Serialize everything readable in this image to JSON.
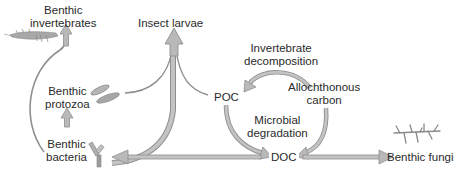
{
  "diagram": {
    "type": "food-web",
    "colors": {
      "arrow_fill": "#b9b9b9",
      "arrow_stroke": "#8e8e8e",
      "text": "#2a2a2a",
      "organism": "#9a9a9a"
    },
    "nodes": {
      "benthic_invertebrates": {
        "line1": "Benthic",
        "line2": "invertebrates",
        "icon": "shrimp-icon"
      },
      "insect_larvae": {
        "line1": "Insect larvae",
        "icon": ""
      },
      "benthic_protozoa": {
        "line1": "Benthic",
        "line2": "protozoa",
        "icon": "protozoa-icon"
      },
      "benthic_bacteria": {
        "line1": "Benthic",
        "line2": "bacteria",
        "icon": "bacteria-icon"
      },
      "poc": {
        "line1": "POC"
      },
      "doc": {
        "line1": "DOC"
      },
      "allochthonous_carbon": {
        "line1": "Allochthonous",
        "line2": "carbon"
      },
      "benthic_fungi": {
        "line1": "Benthic fungi",
        "icon": "fungi-icon"
      }
    },
    "process_labels": {
      "invertebrate_decomposition": {
        "line1": "Invertebrate",
        "line2": "decomposition"
      },
      "microbial_degradation": {
        "line1": "Microbial",
        "line2": "degradation"
      }
    },
    "edges": [
      {
        "from": "Benthic bacteria",
        "to": "Benthic invertebrates"
      },
      {
        "from": "Benthic bacteria",
        "to": "Benthic protozoa"
      },
      {
        "from": "Benthic protozoa",
        "to": "Insect larvae"
      },
      {
        "from": "POC",
        "to": "Insect larvae"
      },
      {
        "from": "Benthic bacteria",
        "to": "Insect larvae"
      },
      {
        "from": "Allochthonous carbon",
        "to": "POC",
        "label": "Invertebrate decomposition"
      },
      {
        "from": "POC",
        "to": "DOC",
        "label": "Microbial degradation"
      },
      {
        "from": "Allochthonous carbon",
        "to": "DOC"
      },
      {
        "from": "DOC",
        "to": "Benthic bacteria"
      },
      {
        "from": "DOC",
        "to": "Benthic fungi"
      }
    ]
  }
}
